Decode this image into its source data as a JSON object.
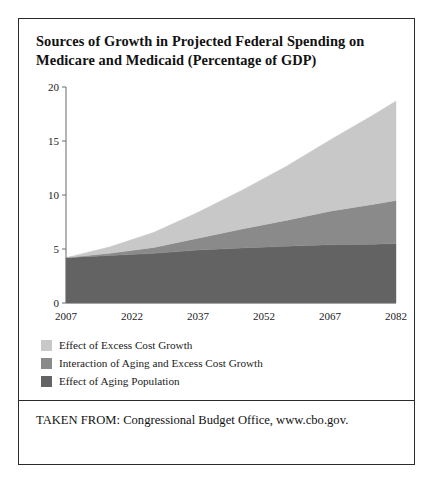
{
  "figure": {
    "title_line1": "Sources of Growth in Projected Federal Spending on",
    "title_line2": "Medicare and Medicaid (Percentage of GDP)",
    "source": "TAKEN FROM: Congressional Budget Office, www.cbo.gov."
  },
  "colors": {
    "excess_cost_growth": "#c8c8c8",
    "interaction": "#8a8a8a",
    "aging_population": "#636363",
    "axis": "#6b6b6b",
    "frame": "#2b2b2b",
    "text": "#1a1a1a"
  },
  "legend": {
    "position": "below-plot",
    "items": [
      {
        "label": "Effect of Excess Cost Growth",
        "color": "#c8c8c8"
      },
      {
        "label": "Interaction of Aging and Excess Cost Growth",
        "color": "#8a8a8a"
      },
      {
        "label": "Effect of Aging Population",
        "color": "#636363"
      }
    ]
  },
  "chart_data": {
    "type": "area",
    "stacked": true,
    "title": "Sources of Growth in Projected Federal Spending on Medicare and Medicaid (Percentage of GDP)",
    "xlabel": "",
    "ylabel": "",
    "xlim": [
      2007,
      2082
    ],
    "ylim": [
      0,
      20
    ],
    "grid": false,
    "x_ticks": [
      2007,
      2022,
      2037,
      2052,
      2067,
      2082
    ],
    "x_tick_labels": [
      "2007",
      "2022",
      "2037",
      "2052",
      "2067",
      "2082"
    ],
    "y_ticks": [
      0,
      5,
      10,
      15,
      20
    ],
    "y_tick_labels": [
      "0",
      "5",
      "10",
      "15",
      "20"
    ],
    "x": [
      2007,
      2017,
      2027,
      2037,
      2047,
      2057,
      2067,
      2077,
      2082
    ],
    "series": [
      {
        "name": "Effect of Aging Population",
        "color": "#636363",
        "values": [
          4.2,
          4.4,
          4.6,
          4.9,
          5.1,
          5.25,
          5.4,
          5.45,
          5.5
        ]
      },
      {
        "name": "Interaction of Aging and Excess Cost Growth",
        "color": "#8a8a8a",
        "values": [
          0.0,
          0.2,
          0.55,
          1.1,
          1.75,
          2.4,
          3.1,
          3.7,
          4.0
        ]
      },
      {
        "name": "Effect of Excess Cost Growth",
        "color": "#c8c8c8",
        "values": [
          0.0,
          0.6,
          1.4,
          2.4,
          3.6,
          5.0,
          6.6,
          8.3,
          9.2
        ]
      }
    ],
    "cumulative_totals": [
      4.2,
      5.2,
      6.55,
      8.4,
      10.45,
      12.65,
      15.1,
      17.45,
      18.7
    ]
  }
}
